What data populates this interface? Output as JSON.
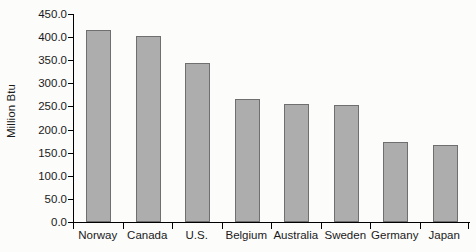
{
  "chart_data": {
    "type": "bar",
    "title": "",
    "subtitle": "",
    "xlabel": "",
    "ylabel": "Million Btu",
    "categories": [
      "Norway",
      "Canada",
      "U.S.",
      "Belgium",
      "Australia",
      "Sweden",
      "Germany",
      "Japan"
    ],
    "values": [
      415.0,
      402.0,
      343.0,
      267.0,
      256.0,
      254.0,
      174.0,
      167.0
    ],
    "ylim": [
      0.0,
      450.0
    ],
    "ytick_labels": [
      "450.0",
      "400.0",
      "350.0",
      "300.0",
      "250.0",
      "200.0",
      "150.0",
      "100.0",
      "50.0",
      "0.0"
    ],
    "ytick_values": [
      450.0,
      400.0,
      350.0,
      300.0,
      250.0,
      200.0,
      150.0,
      100.0,
      50.0,
      0.0
    ],
    "grid": false,
    "legend": "none",
    "annotations": [],
    "bar_color": "#adadad",
    "bar_border_color": "#6f6f6f",
    "axis_color": "#000000",
    "background_color": "#fcfcfa",
    "text_color": "#1a1a1a"
  }
}
